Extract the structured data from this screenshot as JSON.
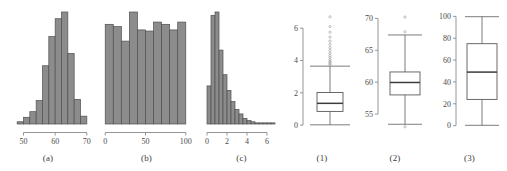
{
  "figure": {
    "background": "#ffffff",
    "bar_fill": "#8c8c8c",
    "bar_stroke": "#4f4f4f",
    "line_color": "#5a5a5a",
    "axis_color": "#8a8a8a",
    "text_color": "#3a3a3a",
    "panels": [
      {
        "id": "a",
        "label": "(a)"
      },
      {
        "id": "b",
        "label": "(b)"
      },
      {
        "id": "c",
        "label": "(c)"
      },
      {
        "id": "1",
        "label": "(1)"
      },
      {
        "id": "2",
        "label": "(2)"
      },
      {
        "id": "3",
        "label": "(3)"
      }
    ]
  },
  "chart_data": [
    {
      "type": "bar",
      "id": "a",
      "title": "(a)",
      "subtitle": "Histogram of an approximately normal distribution",
      "xlabel": "",
      "ylabel": "",
      "grid": false,
      "legend": null,
      "xlim": [
        47,
        71
      ],
      "ylim": [
        0,
        100
      ],
      "xticks": [
        50,
        60,
        70
      ],
      "xtick_labels": [
        "50",
        "60",
        "70"
      ],
      "yticks": [],
      "ytick_labels": [],
      "bin_edges": [
        48,
        50,
        52,
        54,
        56,
        58,
        60,
        62,
        64,
        66,
        68,
        70
      ],
      "categories": [
        "48-50",
        "50-52",
        "52-54",
        "54-56",
        "56-58",
        "58-60",
        "60-62",
        "62-64",
        "64-66",
        "66-68",
        "68-70"
      ],
      "values": [
        2,
        6,
        11,
        21,
        52,
        78,
        94,
        100,
        63,
        22,
        7
      ]
    },
    {
      "type": "bar",
      "id": "b",
      "title": "(b)",
      "subtitle": "Histogram of an approximately uniform distribution",
      "xlabel": "",
      "ylabel": "",
      "grid": false,
      "legend": null,
      "xlim": [
        -4,
        104
      ],
      "ylim": [
        0,
        100
      ],
      "xticks": [
        0,
        50,
        100
      ],
      "xtick_labels": [
        "0",
        "50",
        "100"
      ],
      "yticks": [],
      "ytick_labels": [],
      "bin_edges": [
        0,
        10,
        20,
        30,
        40,
        50,
        60,
        70,
        80,
        90,
        100
      ],
      "categories": [
        "0-10",
        "10-20",
        "20-30",
        "30-40",
        "40-50",
        "50-60",
        "60-70",
        "70-80",
        "80-90",
        "90-100"
      ],
      "values": [
        89,
        87,
        74,
        100,
        84,
        83,
        91,
        89,
        84,
        91
      ]
    },
    {
      "type": "bar",
      "id": "c",
      "title": "(c)",
      "subtitle": "Histogram of a right-skewed distribution",
      "xlabel": "",
      "ylabel": "",
      "grid": false,
      "legend": null,
      "xlim": [
        -0.4,
        7.2
      ],
      "ylim": [
        0,
        100
      ],
      "xticks": [
        0,
        2,
        4,
        6
      ],
      "xtick_labels": [
        "0",
        "2",
        "4",
        "6"
      ],
      "yticks": [],
      "ytick_labels": [],
      "bin_edges": [
        0,
        0.4,
        0.8,
        1.2,
        1.6,
        2.0,
        2.4,
        2.8,
        3.2,
        3.6,
        4.0,
        4.4,
        4.8,
        5.2,
        5.6,
        6.0,
        6.4,
        6.8
      ],
      "categories": [
        "0.0-0.4",
        "0.4-0.8",
        "0.8-1.2",
        "1.2-1.6",
        "1.6-2.0",
        "2.0-2.4",
        "2.4-2.8",
        "2.8-3.2",
        "3.2-3.6",
        "3.6-4.0",
        "4.0-4.4",
        "4.4-4.8",
        "4.8-5.2",
        "5.2-5.6",
        "5.6-6.0",
        "6.0-6.4",
        "6.4-6.8"
      ],
      "values": [
        34,
        97,
        100,
        66,
        44,
        30,
        20,
        13,
        9,
        5,
        3,
        2,
        1,
        1,
        1,
        1,
        1
      ]
    },
    {
      "type": "box",
      "id": "1",
      "title": "(1)",
      "subtitle": "Boxplot of the right-skewed distribution",
      "xlabel": "",
      "ylabel": "",
      "grid": false,
      "legend": null,
      "ylim": [
        -0.3,
        7.0
      ],
      "yticks": [
        0,
        2,
        4,
        6
      ],
      "ytick_labels": [
        "0",
        "2",
        "4",
        "6"
      ],
      "box": {
        "min": 0.02,
        "q1": 0.85,
        "median": 1.35,
        "q3": 2.02,
        "max": 3.65,
        "outliers": [
          3.72,
          3.8,
          3.88,
          3.95,
          4.05,
          4.18,
          4.3,
          4.45,
          4.62,
          4.8,
          5.0,
          5.2,
          5.45,
          5.75,
          6.1,
          6.7
        ]
      }
    },
    {
      "type": "box",
      "id": "2",
      "title": "(2)",
      "subtitle": "Boxplot of the normal distribution",
      "xlabel": "",
      "ylabel": "",
      "grid": false,
      "legend": null,
      "ylim": [
        52.5,
        71.0
      ],
      "yticks": [
        55,
        60,
        65,
        70
      ],
      "ytick_labels": [
        "55",
        "60",
        "65",
        "70"
      ],
      "box": {
        "min": 53.4,
        "q1": 58.0,
        "median": 59.95,
        "q3": 61.6,
        "max": 67.4,
        "outliers": [
          53.0,
          67.9,
          70.2
        ]
      }
    },
    {
      "type": "box",
      "id": "3",
      "title": "(3)",
      "subtitle": "Boxplot of the uniform distribution",
      "xlabel": "",
      "ylabel": "",
      "grid": false,
      "legend": null,
      "ylim": [
        -4,
        104
      ],
      "yticks": [
        0,
        20,
        40,
        60,
        80,
        100
      ],
      "ytick_labels": [
        "0",
        "20",
        "40",
        "60",
        "80",
        "100"
      ],
      "box": {
        "min": 0.3,
        "q1": 24.0,
        "median": 49.0,
        "q3": 75.0,
        "max": 99.7,
        "outliers": []
      }
    }
  ]
}
